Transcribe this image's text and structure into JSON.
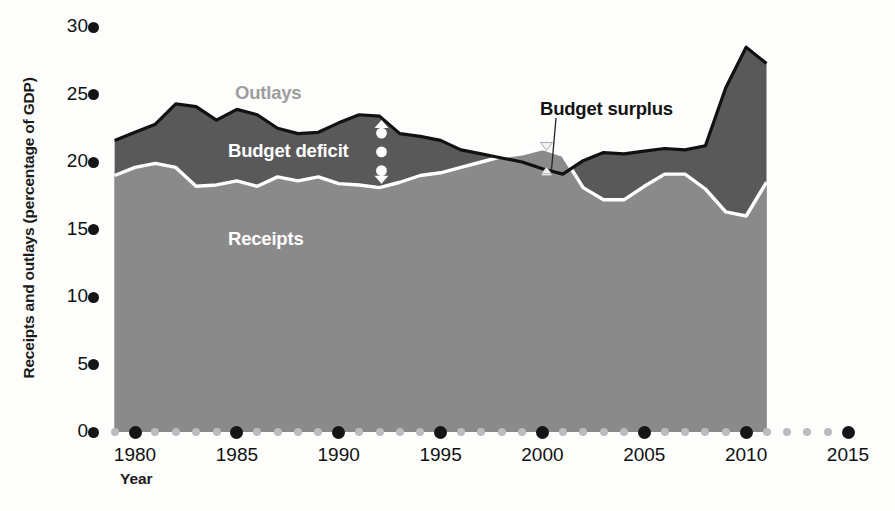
{
  "chart_data": {
    "type": "area",
    "title": "",
    "xlabel": "Year",
    "ylabel": "Receipts and outlays (percentage of GDP)",
    "xlim": [
      1979,
      2012
    ],
    "ylim": [
      0,
      30
    ],
    "grid": false,
    "legend_position": "in-plot annotations",
    "y_ticks": [
      0,
      5,
      10,
      15,
      20,
      25,
      30
    ],
    "y_tick_labels": [
      "0",
      "5",
      "10",
      "15",
      "20",
      "25",
      "30"
    ],
    "x_major_ticks": [
      1980,
      1985,
      1990,
      1995,
      2000,
      2005,
      2010,
      2015
    ],
    "x_major_tick_labels": [
      "1980",
      "1985",
      "1990",
      "1995",
      "2000",
      "2005",
      "2010",
      "2015"
    ],
    "x_minor_ticks": [
      1979,
      1981,
      1982,
      1983,
      1984,
      1986,
      1987,
      1988,
      1989,
      1991,
      1992,
      1993,
      1994,
      1996,
      1997,
      1998,
      1999,
      2001,
      2002,
      2003,
      2004,
      2006,
      2007,
      2008,
      2009,
      2011,
      2012,
      2013,
      2014
    ],
    "x": [
      1979,
      1980,
      1981,
      1982,
      1983,
      1984,
      1985,
      1986,
      1987,
      1988,
      1989,
      1990,
      1991,
      1992,
      1993,
      1994,
      1995,
      1996,
      1997,
      1998,
      1999,
      2000,
      2001,
      2002,
      2003,
      2004,
      2005,
      2006,
      2007,
      2008,
      2009,
      2010,
      2011
    ],
    "series": [
      {
        "name": "Outlays",
        "color": "#595959",
        "values": [
          21.6,
          22.2,
          22.8,
          24.3,
          24.1,
          23.1,
          23.9,
          23.5,
          22.5,
          22.1,
          22.2,
          22.9,
          23.5,
          23.4,
          22.1,
          21.9,
          21.6,
          20.9,
          20.6,
          20.3,
          20.0,
          19.5,
          19.1,
          20.1,
          20.7,
          20.6,
          20.8,
          21.0,
          20.9,
          21.2,
          25.5,
          28.5,
          27.3
        ]
      },
      {
        "name": "Receipts",
        "color": "#8a8a8a",
        "values": [
          19.0,
          19.6,
          19.9,
          19.6,
          18.2,
          18.3,
          18.6,
          18.2,
          18.9,
          18.6,
          18.9,
          18.4,
          18.3,
          18.1,
          18.5,
          19.0,
          19.2,
          19.6,
          20.0,
          20.4,
          20.6,
          21.0,
          20.5,
          18.1,
          17.2,
          17.2,
          18.2,
          19.1,
          19.1,
          18.0,
          16.3,
          16.0,
          18.5
        ]
      }
    ],
    "annotations": [
      {
        "id": "outlays",
        "text": "Outlays",
        "color": "#9d9d9d"
      },
      {
        "id": "deficit",
        "text": "Budget deficit",
        "color": "#ffffff"
      },
      {
        "id": "receipts",
        "text": "Receipts",
        "color": "#ffffff"
      },
      {
        "id": "surplus",
        "text": "Budget surplus",
        "color": "#141414"
      }
    ]
  },
  "axes": {
    "y_title": "Receipts and outlays (percentage of GDP)",
    "x_title": "Year",
    "y_tick_labels": [
      "30",
      "25",
      "20",
      "15",
      "10",
      "5",
      "0"
    ],
    "x_tick_labels": [
      "1980",
      "1985",
      "1990",
      "1995",
      "2000",
      "2005",
      "2010",
      "2015"
    ]
  },
  "labels": {
    "outlays": "Outlays",
    "budget_deficit": "Budget deficit",
    "receipts": "Receipts",
    "budget_surplus": "Budget surplus"
  },
  "colors": {
    "outlays_band": "#595959",
    "receipts_band": "#8a8a8a",
    "outline": "#111111",
    "divider": "#ffffff",
    "tick_major": "#151515",
    "tick_minor": "#bcbcbc",
    "background": "#fdfdfc"
  }
}
